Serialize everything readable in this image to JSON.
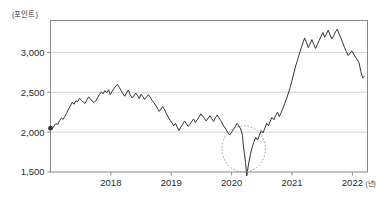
{
  "chart_data": {
    "type": "line",
    "title": "",
    "subtitle": "",
    "xlabel": "(년)",
    "ylabel": "(포인트)",
    "y_unit_label": "(포인트)",
    "x_unit_label": "(년)",
    "xlim": [
      2017.0,
      2022.25
    ],
    "ylim": [
      1500,
      3400
    ],
    "yticks": [
      1500,
      2000,
      2500,
      3000
    ],
    "ytick_labels": [
      "1,500",
      "2,000",
      "2,500",
      "3,000"
    ],
    "xticks": [
      2018,
      2019,
      2020,
      2021,
      2022
    ],
    "xtick_labels": [
      "2018",
      "2019",
      "2020",
      "2021",
      "2022"
    ],
    "grid": "horizontal",
    "gridlines_at": [
      2000,
      2500,
      3000
    ],
    "legend": "none",
    "line_color": "#333333",
    "grid_color": "#cfcfcf",
    "axis_color": "#8a8a8a",
    "background_color": "#ffffff",
    "start_marker": {
      "x": 2017.0,
      "y": 2050,
      "label": ""
    },
    "annotations": [
      {
        "type": "dashed-circle",
        "name": "covid-crash-highlight",
        "center_x": 2020.2,
        "center_y": 1790,
        "radius_x_years": 0.36,
        "radius_y_points": 290,
        "color": "#9a9a9a",
        "label": ""
      }
    ],
    "series": [
      {
        "name": "index",
        "color": "#333333",
        "x": [
          2017.0,
          2017.03,
          2017.06,
          2017.09,
          2017.12,
          2017.15,
          2017.18,
          2017.21,
          2017.24,
          2017.27,
          2017.3,
          2017.33,
          2017.36,
          2017.39,
          2017.42,
          2017.45,
          2017.48,
          2017.51,
          2017.54,
          2017.57,
          2017.6,
          2017.63,
          2017.66,
          2017.69,
          2017.72,
          2017.75,
          2017.78,
          2017.81,
          2017.84,
          2017.87,
          2017.9,
          2017.93,
          2017.96,
          2017.99,
          2018.02,
          2018.05,
          2018.08,
          2018.11,
          2018.14,
          2018.17,
          2018.2,
          2018.23,
          2018.26,
          2018.29,
          2018.32,
          2018.35,
          2018.38,
          2018.41,
          2018.44,
          2018.47,
          2018.5,
          2018.53,
          2018.56,
          2018.59,
          2018.62,
          2018.65,
          2018.68,
          2018.71,
          2018.74,
          2018.77,
          2018.8,
          2018.83,
          2018.86,
          2018.89,
          2018.92,
          2018.95,
          2018.98,
          2019.01,
          2019.04,
          2019.07,
          2019.1,
          2019.13,
          2019.16,
          2019.19,
          2019.22,
          2019.25,
          2019.28,
          2019.31,
          2019.34,
          2019.37,
          2019.4,
          2019.43,
          2019.46,
          2019.49,
          2019.52,
          2019.55,
          2019.58,
          2019.61,
          2019.64,
          2019.67,
          2019.7,
          2019.73,
          2019.76,
          2019.79,
          2019.82,
          2019.85,
          2019.88,
          2019.91,
          2019.94,
          2019.97,
          2020.0,
          2020.03,
          2020.06,
          2020.09,
          2020.12,
          2020.15,
          2020.18,
          2020.19,
          2020.21,
          2020.23,
          2020.25,
          2020.28,
          2020.31,
          2020.34,
          2020.37,
          2020.4,
          2020.43,
          2020.46,
          2020.49,
          2020.52,
          2020.55,
          2020.58,
          2020.61,
          2020.64,
          2020.67,
          2020.7,
          2020.73,
          2020.76,
          2020.79,
          2020.82,
          2020.85,
          2020.88,
          2020.91,
          2020.94,
          2020.97,
          2021.0,
          2021.03,
          2021.06,
          2021.09,
          2021.12,
          2021.15,
          2021.18,
          2021.21,
          2021.24,
          2021.27,
          2021.3,
          2021.33,
          2021.36,
          2021.39,
          2021.42,
          2021.45,
          2021.48,
          2021.51,
          2021.54,
          2021.57,
          2021.6,
          2021.63,
          2021.66,
          2021.69,
          2021.72,
          2021.75,
          2021.78,
          2021.81,
          2021.84,
          2021.87,
          2021.9,
          2021.93,
          2021.96,
          2021.99,
          2022.02,
          2022.05,
          2022.08,
          2022.11,
          2022.14,
          2022.17,
          2022.2
        ],
        "y": [
          2050,
          2045,
          2075,
          2110,
          2095,
          2145,
          2175,
          2160,
          2200,
          2245,
          2290,
          2330,
          2375,
          2350,
          2395,
          2380,
          2425,
          2400,
          2380,
          2360,
          2400,
          2440,
          2420,
          2390,
          2370,
          2395,
          2430,
          2470,
          2505,
          2480,
          2520,
          2495,
          2530,
          2470,
          2510,
          2545,
          2575,
          2600,
          2560,
          2520,
          2480,
          2450,
          2495,
          2530,
          2470,
          2430,
          2455,
          2490,
          2460,
          2420,
          2475,
          2445,
          2410,
          2440,
          2470,
          2440,
          2400,
          2370,
          2340,
          2300,
          2260,
          2290,
          2320,
          2280,
          2230,
          2190,
          2150,
          2120,
          2080,
          2110,
          2060,
          2020,
          2065,
          2100,
          2140,
          2105,
          2070,
          2100,
          2135,
          2165,
          2120,
          2155,
          2190,
          2230,
          2200,
          2170,
          2140,
          2175,
          2205,
          2170,
          2135,
          2180,
          2215,
          2180,
          2145,
          2100,
          2065,
          2030,
          1990,
          1965,
          2000,
          2035,
          2070,
          2110,
          2080,
          2040,
          1960,
          1860,
          1740,
          1620,
          1450,
          1600,
          1720,
          1810,
          1880,
          1935,
          1900,
          1960,
          2020,
          1990,
          2050,
          2110,
          2080,
          2140,
          2185,
          2155,
          2210,
          2250,
          2195,
          2245,
          2300,
          2360,
          2420,
          2490,
          2560,
          2650,
          2740,
          2830,
          2900,
          2980,
          3050,
          3120,
          3180,
          3120,
          3060,
          3110,
          3160,
          3100,
          3050,
          3100,
          3150,
          3200,
          3250,
          3190,
          3230,
          3280,
          3220,
          3170,
          3210,
          3260,
          3290,
          3230,
          3180,
          3120,
          3060,
          3010,
          2960,
          2990,
          3020,
          2980,
          2940,
          2910,
          2870,
          2760,
          2680,
          2700
        ]
      }
    ]
  }
}
